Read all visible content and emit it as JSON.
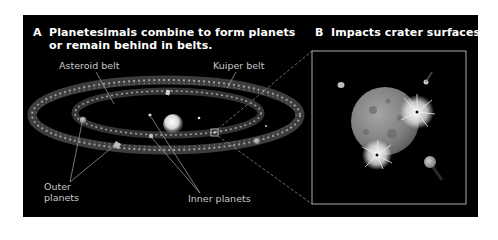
{
  "panels": {
    "a": {
      "letter": "A",
      "title_line1": "Planetesimals combine to form planets",
      "title_line2": "or remain behind in belts.",
      "labels": {
        "asteroid_belt": "Asteroid belt",
        "kuiper_belt": "Kuiper belt",
        "outer_planets_line1": "Outer",
        "outer_planets_line2": "planets",
        "inner_planets": "Inner planets"
      }
    },
    "b": {
      "letter": "B",
      "title": "Impacts crater surfaces."
    }
  },
  "colors": {
    "background": "#000000",
    "page": "#ffffff",
    "title_text": "#ffffff",
    "label_text": "#c9c9c9",
    "belt": "#9a9a9a",
    "inset_border": "#bdbdbd"
  }
}
